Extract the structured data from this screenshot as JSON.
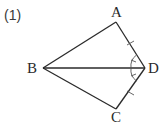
{
  "problem": {
    "number_label": "(1)"
  },
  "figure": {
    "type": "geometry",
    "shape": "kite ABCD with diagonal BD",
    "points": {
      "A": {
        "label": "A",
        "x": 116,
        "y": 22
      },
      "B": {
        "label": "B",
        "x": 43,
        "y": 68
      },
      "C": {
        "label": "C",
        "x": 116,
        "y": 109
      },
      "D": {
        "label": "D",
        "x": 145,
        "y": 68
      }
    },
    "segments": [
      "AB",
      "BC",
      "CD",
      "DA",
      "BD"
    ],
    "marks": {
      "equal_sides": [
        "AD",
        "CD"
      ],
      "equal_angles": [
        "ADB",
        "CDB"
      ]
    },
    "colors": {
      "stroke": "#2a2a2a",
      "mark": "#555555"
    }
  }
}
